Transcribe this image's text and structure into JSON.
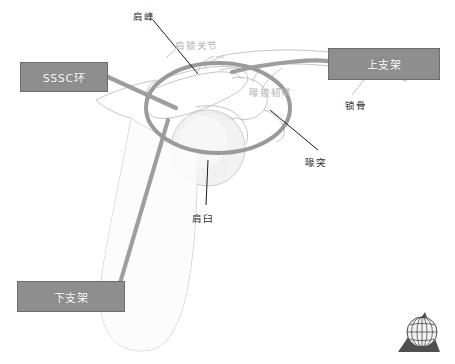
{
  "figure": {
    "colors": {
      "box_fill": "#8e8e8e",
      "box_border": "#6d6d6d",
      "box_text": "#ffffff",
      "strut": "#9a9a9a",
      "ring": "#9a9a9a",
      "bone_outline": "#b9b9b9",
      "bone_fill": "#fbfbfb",
      "humeral_head_fill": "#eeeeee",
      "leader_line": "#1a1a1a",
      "annotation_text": "#2b2b2b",
      "faint_text": "#b4b4b4",
      "logo_dark": "#4a4a4a"
    },
    "callouts": [
      {
        "id": "sssc-ring",
        "label": "SSSC环",
        "x": 20,
        "y": 62,
        "w": 88,
        "h": 30
      },
      {
        "id": "upper-strut",
        "label": "上支架",
        "x": 328,
        "y": 48,
        "w": 112,
        "h": 32
      },
      {
        "id": "lower-strut",
        "label": "下支架",
        "x": 17,
        "y": 281,
        "w": 108,
        "h": 31
      }
    ],
    "annotations": [
      {
        "id": "acromion",
        "label": "肩峰",
        "x": 133,
        "y": 9,
        "faint": false
      },
      {
        "id": "acromioclavicular",
        "label": "肩锁关节",
        "x": 175,
        "y": 38,
        "faint": true
      },
      {
        "id": "coracoclavicular-lig",
        "label": "喙锁韧带",
        "x": 249,
        "y": 85,
        "faint": true
      },
      {
        "id": "clavicle",
        "label": "锁骨",
        "x": 345,
        "y": 98,
        "faint": false
      },
      {
        "id": "coracoid",
        "label": "喙突",
        "x": 305,
        "y": 155,
        "faint": false
      },
      {
        "id": "glenoid",
        "label": "肩臼",
        "x": 192,
        "y": 211,
        "faint": false
      }
    ],
    "logo": {
      "name": "globe-logo",
      "x": 395,
      "y": 312,
      "w": 48,
      "h": 42
    }
  }
}
